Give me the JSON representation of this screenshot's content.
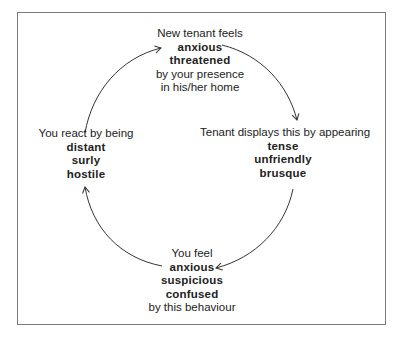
{
  "diagram": {
    "type": "cycle",
    "direction": "clockwise",
    "nodes": {
      "top": {
        "intro": "New tenant feels",
        "emphasis": [
          "anxious",
          "threatened"
        ],
        "outro": [
          "by your presence",
          "in his/her home"
        ]
      },
      "right": {
        "intro": "Tenant displays this by appearing",
        "emphasis": [
          "tense",
          "unfriendly",
          "brusque"
        ],
        "outro": []
      },
      "bottom": {
        "intro": "You feel",
        "emphasis": [
          "anxious",
          "suspicious",
          "confused"
        ],
        "outro": [
          "by this behaviour"
        ]
      },
      "left": {
        "intro": "You react by being",
        "emphasis": [
          "distant",
          "surly",
          "hostile"
        ],
        "outro": []
      }
    },
    "edges": [
      {
        "from": "top",
        "to": "right"
      },
      {
        "from": "right",
        "to": "bottom"
      },
      {
        "from": "bottom",
        "to": "left"
      },
      {
        "from": "left",
        "to": "top"
      }
    ],
    "colors": {
      "text": "#222222",
      "arrow": "#333333",
      "frame": "#7a7a7a",
      "background": "#ffffff"
    }
  }
}
